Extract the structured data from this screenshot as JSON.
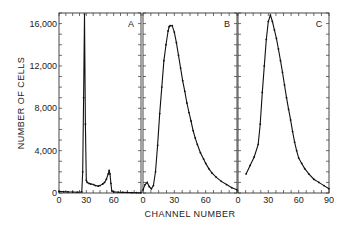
{
  "chart_data": {
    "type": "line",
    "ylabel": "NUMBER OF CELLS",
    "xlabel": "CHANNEL NUMBER",
    "ylim": [
      0,
      17000
    ],
    "yticks": [
      0,
      4000,
      8000,
      12000,
      16000
    ],
    "ytick_labels": [
      "0",
      "4,000",
      "8,000",
      "12,000",
      "16,000"
    ],
    "grid": false,
    "panels": [
      {
        "label": "A",
        "xlim": [
          0,
          90
        ],
        "xticks": [
          0,
          30,
          60
        ],
        "xtick_labels": [
          "0",
          "30",
          "60"
        ],
        "x": [
          0,
          5,
          10,
          15,
          20,
          25,
          26,
          27,
          28,
          29,
          30,
          31,
          33,
          35,
          38,
          40,
          43,
          45,
          48,
          50,
          52,
          54,
          55,
          56,
          57,
          58,
          60,
          65,
          70,
          75,
          80,
          85,
          90
        ],
        "y": [
          150,
          120,
          100,
          90,
          80,
          100,
          2000,
          9000,
          16900,
          6500,
          1200,
          1000,
          900,
          850,
          800,
          700,
          650,
          700,
          850,
          1000,
          1300,
          1800,
          2100,
          1800,
          900,
          200,
          100,
          80,
          60,
          50,
          40,
          30,
          20
        ]
      },
      {
        "label": "B",
        "xlim": [
          0,
          90
        ],
        "xticks": [
          0,
          30,
          60
        ],
        "xtick_labels": [
          "0",
          "30",
          "60"
        ],
        "x": [
          0,
          2,
          4,
          6,
          8,
          10,
          12,
          14,
          16,
          18,
          20,
          22,
          24,
          25,
          26,
          28,
          30,
          32,
          34,
          36,
          38,
          40,
          42,
          44,
          46,
          48,
          50,
          52,
          55,
          58,
          60,
          63,
          66,
          70,
          75,
          80,
          85,
          90
        ],
        "y": [
          300,
          800,
          1000,
          600,
          400,
          700,
          2000,
          4500,
          7500,
          10000,
          12500,
          14000,
          15300,
          15700,
          15800,
          15800,
          15200,
          14200,
          13000,
          11800,
          10600,
          9600,
          8500,
          7600,
          6800,
          5900,
          5200,
          4600,
          3800,
          3200,
          2800,
          2300,
          1900,
          1500,
          1100,
          800,
          500,
          300
        ]
      },
      {
        "label": "C",
        "xlim": [
          0,
          90
        ],
        "xticks": [
          0,
          30,
          60,
          90
        ],
        "xtick_labels": [
          "0",
          "30",
          "60",
          "90"
        ],
        "x": [
          8,
          12,
          16,
          20,
          22,
          24,
          26,
          28,
          30,
          32,
          34,
          36,
          38,
          40,
          42,
          44,
          46,
          48,
          50,
          52,
          54,
          56,
          58,
          60,
          63,
          66,
          70,
          75,
          80,
          85,
          90
        ],
        "y": [
          1800,
          2600,
          3400,
          4600,
          6500,
          9500,
          12000,
          14500,
          16200,
          16800,
          16200,
          15400,
          14600,
          13600,
          12500,
          11400,
          10200,
          9000,
          7900,
          6900,
          5800,
          4800,
          4000,
          3300,
          2800,
          2300,
          1800,
          1300,
          1000,
          700,
          400
        ]
      }
    ]
  }
}
